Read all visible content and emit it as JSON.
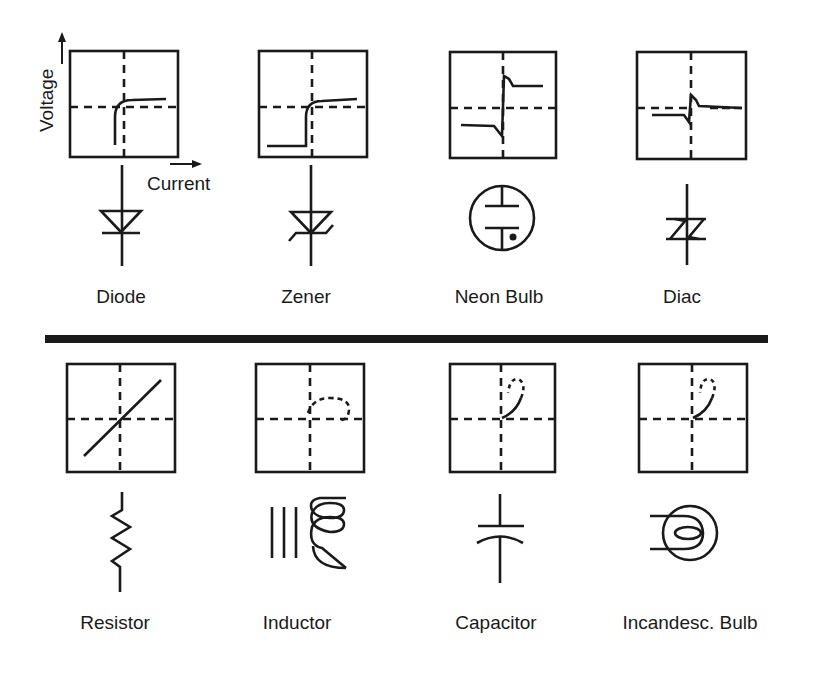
{
  "figure": {
    "axis_labels": {
      "y": "Voltage",
      "x": "Current"
    },
    "top_row": [
      {
        "label": "Diode",
        "curve": "diode-iv-curve",
        "symbol": "diode-symbol"
      },
      {
        "label": "Zener",
        "curve": "zener-iv-curve",
        "symbol": "zener-symbol"
      },
      {
        "label": "Neon Bulb",
        "curve": "neon-bulb-iv-curve",
        "symbol": "neon-bulb-symbol"
      },
      {
        "label": "Diac",
        "curve": "diac-iv-curve",
        "symbol": "diac-symbol"
      }
    ],
    "bottom_row": [
      {
        "label": "Resistor",
        "curve": "resistor-iv-curve",
        "symbol": "resistor-symbol"
      },
      {
        "label": "Inductor",
        "curve": "inductor-iv-curve",
        "symbol": "inductor-symbol"
      },
      {
        "label": "Capacitor",
        "curve": "capacitor-iv-curve",
        "symbol": "capacitor-symbol"
      },
      {
        "label": "Incandesc. Bulb",
        "curve": "incandescent-bulb-iv-curve",
        "symbol": "incandescent-bulb-symbol"
      }
    ],
    "colors": {
      "ink": "#1a1a1a",
      "paper": "#ffffff",
      "bleed_through": "#ececec"
    }
  }
}
